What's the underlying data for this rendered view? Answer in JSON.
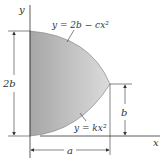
{
  "figure": {
    "axes": {
      "x_label": "x",
      "y_label": "y"
    },
    "curves": {
      "upper": {
        "equation": "y = 2b − cx²"
      },
      "lower": {
        "equation": "y = kx²"
      }
    },
    "dimensions": {
      "height_total": "2b",
      "height_tip": "b",
      "width": "a"
    },
    "colors": {
      "fill_left": "#a8a8a8",
      "fill_right": "#d8d8d8",
      "line": "#333333"
    }
  }
}
